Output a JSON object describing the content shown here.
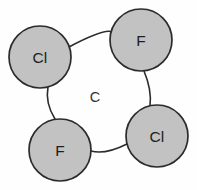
{
  "diagram": {
    "type": "molecular-structure",
    "background_color": "#fefefe",
    "center_atom": {
      "label": "C",
      "x": 95,
      "y": 97,
      "name": "carbon"
    },
    "atom_fill_color": "#c2c2c2",
    "atom_stroke_color": "#2b2b2b",
    "bond_stroke_color": "#2b2b2b",
    "atoms": [
      {
        "id": "atom-cl-top-left",
        "label": "Cl",
        "element": "chlorine",
        "cx": 40,
        "cy": 57,
        "r": 31
      },
      {
        "id": "atom-f-top-right",
        "label": "F",
        "element": "fluorine",
        "cx": 141,
        "cy": 40,
        "r": 31
      },
      {
        "id": "atom-cl-bottom-right",
        "label": "Cl",
        "element": "chlorine",
        "cx": 157,
        "cy": 136,
        "r": 31
      },
      {
        "id": "atom-f-bottom-left",
        "label": "F",
        "element": "fluorine",
        "cx": 60,
        "cy": 150,
        "r": 31
      }
    ],
    "bonds": [
      {
        "id": "bond-cl-topleft-to-f-topright",
        "from": "atom-cl-top-left",
        "to": "atom-f-top-right",
        "path": "M 69 47 Q 105 28 112 32"
      },
      {
        "id": "bond-f-topright-to-cl-bottomright",
        "from": "atom-f-top-right",
        "to": "atom-cl-bottom-right",
        "path": "M 144 71 Q 152 90 150 106"
      },
      {
        "id": "bond-cl-bottomright-to-f-bottomleft",
        "from": "atom-cl-bottom-right",
        "to": "atom-f-bottom-left",
        "path": "M 127 144 Q 105 155 91 151"
      },
      {
        "id": "bond-f-bottomleft-to-cl-topleft",
        "from": "atom-f-bottom-left",
        "to": "atom-cl-top-left",
        "path": "M 55 119 Q 45 103 48 87"
      }
    ]
  }
}
